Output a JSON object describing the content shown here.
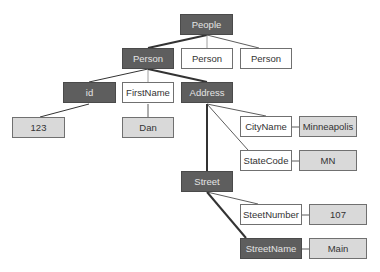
{
  "colors": {
    "dark_fill": "#5e5e5e",
    "dark_text": "#e4e4e4",
    "value_fill": "#d9d9d9",
    "element_fill": "#ffffff",
    "line": "#333333"
  },
  "nodes": {
    "people": {
      "label": "People",
      "style": "dark"
    },
    "person1": {
      "label": "Person",
      "style": "dark"
    },
    "person2": {
      "label": "Person",
      "style": "white"
    },
    "person3": {
      "label": "Person",
      "style": "white"
    },
    "id": {
      "label": "id",
      "style": "dark"
    },
    "firstname": {
      "label": "FirstName",
      "style": "white"
    },
    "address": {
      "label": "Address",
      "style": "dark"
    },
    "id_value": {
      "label": "123",
      "style": "gray"
    },
    "firstname_value": {
      "label": "Dan",
      "style": "gray"
    },
    "cityname": {
      "label": "CityName",
      "style": "white"
    },
    "cityname_value": {
      "label": "Minneapolis",
      "style": "gray"
    },
    "statecode": {
      "label": "StateCode",
      "style": "white"
    },
    "statecode_value": {
      "label": "MN",
      "style": "gray"
    },
    "street": {
      "label": "Street",
      "style": "dark"
    },
    "streetnumber": {
      "label": "SteetNumber",
      "style": "white"
    },
    "streetnumber_value": {
      "label": "107",
      "style": "gray"
    },
    "streetname": {
      "label": "StreetName",
      "style": "dark"
    },
    "streetname_value": {
      "label": "Main",
      "style": "gray"
    }
  }
}
